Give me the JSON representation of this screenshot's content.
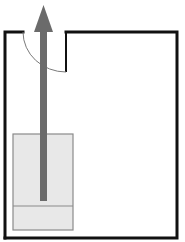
{
  "diagram": {
    "type": "floor-plan",
    "canvas": {
      "width": 185,
      "height": 242
    },
    "colors": {
      "wall": "#111111",
      "door_arc": "#7a7a7a",
      "object_fill": "#e8e8e8",
      "object_stroke": "#8a8a8a",
      "arrow": "#6b6b6b",
      "background": "#ffffff"
    },
    "room": {
      "left": 5,
      "top": 32,
      "right": 177,
      "bottom": 238,
      "wall_width": 3,
      "door_gap": {
        "start_x": 23,
        "end_x": 66
      }
    },
    "door": {
      "hinge_x": 66,
      "jamb_bottom_y": 72,
      "swing_from": [
        23,
        32
      ],
      "swing_to": [
        66,
        72
      ]
    },
    "object": {
      "label": "",
      "x": 13,
      "y": 134,
      "width": 60,
      "height": 96,
      "divider_y": 206
    },
    "arrow": {
      "direction": "up",
      "tail": [
        43.5,
        201
      ],
      "tip": [
        43.5,
        5
      ],
      "shaft_width": 7,
      "head_width": 19,
      "head_length": 27
    }
  }
}
